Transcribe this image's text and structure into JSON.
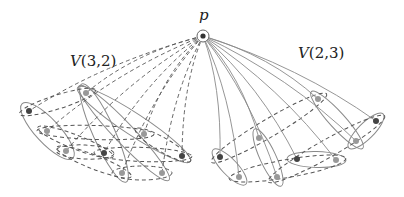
{
  "diagram": {
    "apex": {
      "label": "p",
      "x": 203,
      "y": 36,
      "label_x": 199,
      "label_y": 20
    },
    "labels": {
      "left_group": {
        "func": "V",
        "args": "(3,2)",
        "x": 70,
        "y": 66
      },
      "right_group": {
        "func": "V",
        "args": "(2,3)",
        "x": 298,
        "y": 58
      }
    },
    "colors": {
      "line": "#888888",
      "dashed": "#555555",
      "dot_dark": "#444444",
      "dot_medium": "#999999",
      "apex_fill": "#333333"
    },
    "left_dots": [
      {
        "x": 29,
        "y": 111,
        "tone": "dark"
      },
      {
        "x": 47,
        "y": 131,
        "tone": "medium"
      },
      {
        "x": 66,
        "y": 151,
        "tone": "medium"
      },
      {
        "x": 86,
        "y": 93,
        "tone": "medium"
      },
      {
        "x": 104,
        "y": 153,
        "tone": "dark"
      },
      {
        "x": 122,
        "y": 173,
        "tone": "medium"
      },
      {
        "x": 144,
        "y": 134,
        "tone": "medium"
      },
      {
        "x": 162,
        "y": 173,
        "tone": "medium"
      },
      {
        "x": 182,
        "y": 156,
        "tone": "dark"
      }
    ],
    "right_dots": [
      {
        "x": 220,
        "y": 157,
        "tone": "dark"
      },
      {
        "x": 239,
        "y": 177,
        "tone": "medium"
      },
      {
        "x": 259,
        "y": 138,
        "tone": "medium"
      },
      {
        "x": 277,
        "y": 177,
        "tone": "medium"
      },
      {
        "x": 297,
        "y": 159,
        "tone": "dark"
      },
      {
        "x": 318,
        "y": 99,
        "tone": "medium"
      },
      {
        "x": 336,
        "y": 160,
        "tone": "medium"
      },
      {
        "x": 356,
        "y": 141,
        "tone": "medium"
      },
      {
        "x": 376,
        "y": 121,
        "tone": "dark"
      }
    ]
  }
}
